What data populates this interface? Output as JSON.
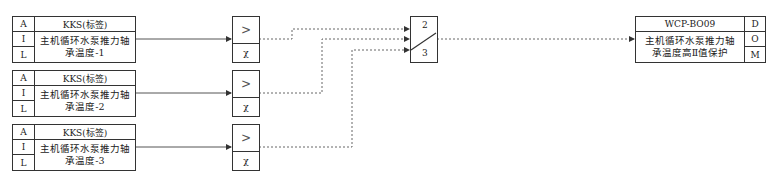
{
  "inputs": [
    {
      "a": "A",
      "tag": "KKS(标签)",
      "i": "I",
      "l": "L",
      "desc": "主机循环水泵推力轴\n承温度-1"
    },
    {
      "a": "A",
      "tag": "KKS(标签)",
      "i": "I",
      "l": "L",
      "desc": "主机循环水泵推力轴\n承温度-2"
    },
    {
      "a": "A",
      "tag": "KKS(标签)",
      "i": "I",
      "l": "L",
      "desc": "主机循环水泵推力轴\n承温度-3"
    }
  ],
  "comparators": [
    {
      "op": ">",
      "sym": "χ"
    },
    {
      "op": ">",
      "sym": "χ"
    },
    {
      "op": ">",
      "sym": "χ"
    }
  ],
  "vote": {
    "top": "2",
    "bottom": "3"
  },
  "output": {
    "tag": "WCP-BO09",
    "d": "D",
    "o": "O",
    "m": "M",
    "desc": "主机循环水泵推力轴\n承温度高Ⅱ值保护"
  }
}
